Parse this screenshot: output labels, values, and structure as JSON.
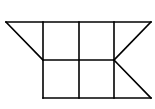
{
  "diagram": {
    "stroke_color": "#000000",
    "background": "#ffffff",
    "points": {
      "A": [
        6,
        22
      ],
      "B": [
        43,
        22
      ],
      "C": [
        79,
        22
      ],
      "D": [
        114,
        22
      ],
      "E": [
        151,
        22
      ],
      "F": [
        43,
        60
      ],
      "G": [
        79,
        60
      ],
      "H": [
        114,
        60
      ],
      "I": [
        43,
        98
      ],
      "J": [
        79,
        98
      ],
      "K": [
        114,
        98
      ],
      "L": [
        151,
        98
      ]
    },
    "segments": [
      [
        "A",
        "E"
      ],
      [
        "F",
        "H"
      ],
      [
        "I",
        "L"
      ],
      [
        "B",
        "I"
      ],
      [
        "C",
        "J"
      ],
      [
        "D",
        "K"
      ],
      [
        "A",
        "F"
      ],
      [
        "E",
        "H"
      ],
      [
        "H",
        "L"
      ]
    ]
  }
}
